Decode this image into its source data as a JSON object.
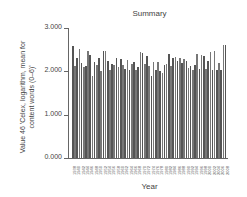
{
  "chart_data": {
    "type": "bar",
    "title": "Summary",
    "xlabel": "Year",
    "ylabel": "Value 46 'Celex, logarithm, mean for content words (0–6)'",
    "ylim": [
      0,
      3
    ],
    "yticks": [
      "0.000",
      "1.000",
      "2.000",
      "3.000"
    ],
    "xticks_visible": [
      "1938",
      "1940",
      "1942",
      "1944",
      "1946",
      "1948",
      "1950",
      "1952",
      "1954",
      "1956",
      "1958",
      "1960",
      "1962",
      "1964",
      "1966",
      "1968",
      "1970",
      "1972",
      "1974",
      "1976",
      "1978",
      "1980",
      "1982",
      "1984",
      "1986",
      "1988",
      "1990",
      "1992",
      "1994",
      "1996",
      "1998",
      "2000",
      "2002",
      "2004",
      "2006",
      "2008"
    ],
    "categories": [
      "1938",
      "1939",
      "1940",
      "1941",
      "1942",
      "1943",
      "1944",
      "1945",
      "1946",
      "1947",
      "1948",
      "1949",
      "1950",
      "1951",
      "1952",
      "1953",
      "1954",
      "1955",
      "1956",
      "1957",
      "1958",
      "1959",
      "1960",
      "1961",
      "1962",
      "1963",
      "1964",
      "1965",
      "1966",
      "1967",
      "1968",
      "1969",
      "1970",
      "1971",
      "1972",
      "1973",
      "1974",
      "1975",
      "1976",
      "1977",
      "1978",
      "1979",
      "1980",
      "1981",
      "1982",
      "1983",
      "1984",
      "1985",
      "1986",
      "1987",
      "1988",
      "1989",
      "1990",
      "1991",
      "1992",
      "1993",
      "1994",
      "1995",
      "1996",
      "1997",
      "1998",
      "1999",
      "2000",
      "2001",
      "2002",
      "2003",
      "2004",
      "2005",
      "2006",
      "2007",
      "2008"
    ],
    "values": [
      2.58,
      2.12,
      2.3,
      2.52,
      2.2,
      2.1,
      2.12,
      2.46,
      2.38,
      1.9,
      2.22,
      2.14,
      2.3,
      2.0,
      2.48,
      2.46,
      2.24,
      2.04,
      2.16,
      2.14,
      2.3,
      2.1,
      2.28,
      2.14,
      2.06,
      2.26,
      2.04,
      2.18,
      2.22,
      2.04,
      2.1,
      2.44,
      2.42,
      2.16,
      2.36,
      2.12,
      1.9,
      2.22,
      2.02,
      2.22,
      2.0,
      1.96,
      2.14,
      2.18,
      2.4,
      2.12,
      2.3,
      2.32,
      2.24,
      2.3,
      2.2,
      2.28,
      2.24,
      2.08,
      2.12,
      2.04,
      2.14,
      2.4,
      2.06,
      2.38,
      2.36,
      2.06,
      2.24,
      2.44,
      2.02,
      2.46,
      2.02,
      2.2,
      2.02,
      2.6,
      2.6
    ],
    "grid": false,
    "legend": null
  }
}
